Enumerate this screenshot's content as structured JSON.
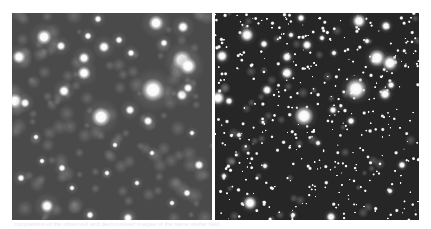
{
  "figure": {
    "colors": {
      "left_background": "#4a4a4a",
      "right_background": "#262626",
      "star_core": "#ffffff",
      "page_background": "#ffffff"
    },
    "panels": [
      {
        "id": "left",
        "label": "",
        "width": 200,
        "height": 207,
        "blur_scale": 1.0,
        "stars": [
          [
            144,
            10,
            8
          ],
          [
            32,
            24,
            8
          ],
          [
            170,
            47,
            10
          ],
          [
            176,
            53,
            9
          ],
          [
            141,
            77,
            12
          ],
          [
            89,
            104,
            10
          ],
          [
            7,
            44,
            7
          ],
          [
            72,
            60,
            7
          ],
          [
            72,
            45,
            6
          ],
          [
            92,
            34,
            6
          ],
          [
            3,
            88,
            8
          ],
          [
            13,
            90,
            5
          ],
          [
            170,
            82,
            6
          ],
          [
            176,
            75,
            5
          ],
          [
            35,
            193,
            7
          ],
          [
            52,
            78,
            6
          ],
          [
            118,
            97,
            5
          ],
          [
            136,
            108,
            5
          ],
          [
            187,
            152,
            5
          ],
          [
            171,
            14,
            6
          ],
          [
            152,
            30,
            4
          ],
          [
            49,
            33,
            5
          ],
          [
            107,
            27,
            4
          ],
          [
            119,
            40,
            4
          ],
          [
            86,
            6,
            4
          ],
          [
            76,
            23,
            4
          ],
          [
            9,
            165,
            4
          ],
          [
            50,
            155,
            4
          ],
          [
            116,
            205,
            5
          ],
          [
            78,
            202,
            4
          ],
          [
            175,
            180,
            4
          ],
          [
            103,
            132,
            3
          ],
          [
            24,
            124,
            3
          ],
          [
            60,
            175,
            3
          ],
          [
            140,
            140,
            3
          ],
          [
            160,
            190,
            3
          ],
          [
            30,
            148,
            3
          ],
          [
            95,
            160,
            3
          ],
          [
            125,
            170,
            3
          ],
          [
            180,
            120,
            3
          ]
        ]
      },
      {
        "id": "right",
        "label": "",
        "width": 204,
        "height": 207,
        "blur_scale": 0.75,
        "stars": [
          [
            144,
            8,
            7
          ],
          [
            32,
            22,
            7
          ],
          [
            162,
            45,
            9
          ],
          [
            175,
            50,
            8
          ],
          [
            141,
            76,
            11
          ],
          [
            89,
            103,
            10
          ],
          [
            7,
            43,
            6
          ],
          [
            72,
            60,
            6
          ],
          [
            72,
            44,
            5
          ],
          [
            92,
            32,
            5
          ],
          [
            3,
            85,
            7
          ],
          [
            14,
            88,
            4
          ],
          [
            170,
            81,
            6
          ],
          [
            176,
            72,
            4
          ],
          [
            35,
            190,
            7
          ],
          [
            52,
            77,
            5
          ],
          [
            118,
            97,
            4
          ],
          [
            136,
            108,
            4
          ],
          [
            187,
            152,
            4
          ],
          [
            171,
            13,
            5
          ],
          [
            152,
            28,
            3
          ],
          [
            49,
            31,
            4
          ],
          [
            107,
            25,
            3
          ],
          [
            119,
            40,
            3
          ],
          [
            86,
            5,
            4
          ],
          [
            76,
            22,
            3
          ],
          [
            9,
            163,
            3
          ],
          [
            50,
            153,
            3
          ],
          [
            116,
            204,
            5
          ],
          [
            78,
            202,
            3
          ],
          [
            175,
            178,
            3
          ],
          [
            103,
            130,
            3
          ],
          [
            24,
            122,
            3
          ]
        ],
        "faint_star_count": 420,
        "faint_star_seed": 7
      }
    ],
    "caption": "comparison of the observed and deconvolved images of the same stellar field"
  }
}
